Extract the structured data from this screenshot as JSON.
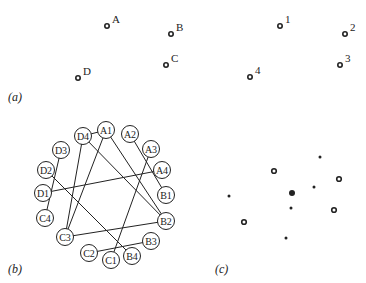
{
  "panels": {
    "a": {
      "label": "(a)",
      "points": [
        {
          "id": "A",
          "x": 107,
          "y": 26
        },
        {
          "id": "B",
          "x": 171,
          "y": 34
        },
        {
          "id": "C",
          "x": 166,
          "y": 65
        },
        {
          "id": "D",
          "x": 78,
          "y": 78
        }
      ]
    },
    "a_numbered": {
      "points": [
        {
          "id": "1",
          "x": 280,
          "y": 26
        },
        {
          "id": "2",
          "x": 345,
          "y": 34
        },
        {
          "id": "3",
          "x": 340,
          "y": 65
        },
        {
          "id": "4",
          "x": 250,
          "y": 77
        }
      ]
    },
    "b": {
      "label": "(b)",
      "nodes": [
        {
          "id": "A1",
          "x": 106,
          "y": 130
        },
        {
          "id": "A2",
          "x": 130,
          "y": 134
        },
        {
          "id": "A3",
          "x": 151,
          "y": 149
        },
        {
          "id": "A4",
          "x": 162,
          "y": 170
        },
        {
          "id": "B1",
          "x": 166,
          "y": 195
        },
        {
          "id": "B2",
          "x": 166,
          "y": 221
        },
        {
          "id": "B3",
          "x": 151,
          "y": 241
        },
        {
          "id": "B4",
          "x": 132,
          "y": 256
        },
        {
          "id": "C1",
          "x": 111,
          "y": 260
        },
        {
          "id": "C2",
          "x": 89,
          "y": 253
        },
        {
          "id": "C3",
          "x": 65,
          "y": 237
        },
        {
          "id": "C4",
          "x": 45,
          "y": 218
        },
        {
          "id": "D1",
          "x": 43,
          "y": 193
        },
        {
          "id": "D2",
          "x": 46,
          "y": 170
        },
        {
          "id": "D3",
          "x": 61,
          "y": 150
        },
        {
          "id": "D4",
          "x": 83,
          "y": 136
        }
      ],
      "edges": [
        [
          "D4",
          "A1"
        ],
        [
          "A1",
          "C3"
        ],
        [
          "A1",
          "B2"
        ],
        [
          "D4",
          "C3"
        ],
        [
          "D4",
          "B2"
        ],
        [
          "A2",
          "B1"
        ],
        [
          "A3",
          "C1"
        ],
        [
          "A4",
          "D1"
        ],
        [
          "D3",
          "C4"
        ],
        [
          "D2",
          "B4"
        ],
        [
          "C3",
          "B2"
        ],
        [
          "C2",
          "B3"
        ]
      ]
    },
    "c": {
      "label": "(c)",
      "rings": [
        {
          "x": 274,
          "y": 171
        },
        {
          "x": 339,
          "y": 179
        },
        {
          "x": 334,
          "y": 210
        },
        {
          "x": 244,
          "y": 222
        }
      ],
      "dots": [
        {
          "x": 320,
          "y": 157,
          "r": 1.5
        },
        {
          "x": 314,
          "y": 187,
          "r": 1.5
        },
        {
          "x": 229,
          "y": 196,
          "r": 1.5
        },
        {
          "x": 292,
          "y": 193,
          "r": 3
        },
        {
          "x": 291,
          "y": 208,
          "r": 1.5
        },
        {
          "x": 286,
          "y": 238,
          "r": 1.5
        }
      ]
    }
  }
}
